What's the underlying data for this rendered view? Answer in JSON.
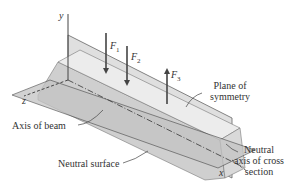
{
  "diagram": {
    "axes": {
      "y": "y",
      "z": "z",
      "x": "x"
    },
    "forces": [
      {
        "label": "F",
        "sub": "1",
        "direction": "down"
      },
      {
        "label": "F",
        "sub": "2",
        "direction": "down"
      },
      {
        "label": "F",
        "sub": "3",
        "direction": "up"
      }
    ],
    "labels": {
      "plane_of_symmetry_1": "Plane of",
      "plane_of_symmetry_2": "symmetry",
      "axis_of_beam": "Axis of beam",
      "neutral_surface": "Neutral surface",
      "neutral_axis_1": "Neutral",
      "neutral_axis_2": "axis of cross",
      "neutral_axis_3": "section"
    },
    "colors": {
      "beam_top": "#e6e6e6",
      "beam_side": "#cfcfcf",
      "plane": "#bdbdbd",
      "line": "#444444"
    }
  }
}
